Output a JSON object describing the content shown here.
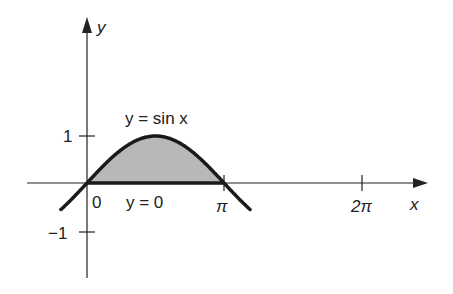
{
  "diagram": {
    "title": "",
    "axes": {
      "x_label": "x",
      "y_label": "y",
      "x_ticks": [
        "0",
        "π",
        "2π"
      ],
      "y_ticks": [
        "1",
        "−1"
      ]
    },
    "curves": [
      {
        "label": "y = sin x",
        "type": "sine"
      },
      {
        "label": "y = 0",
        "type": "baseline"
      }
    ],
    "shaded_region": {
      "from": "0",
      "to": "π",
      "color": "#b8b8b8"
    },
    "colors": {
      "curve": "#1a1a1a",
      "axes": "#222222",
      "fill": "#b8b8b8"
    }
  },
  "chart_data": {
    "type": "line",
    "title": "",
    "xlabel": "x",
    "ylabel": "y",
    "x_tick_labels": [
      "0",
      "π",
      "2π"
    ],
    "y_tick_labels": [
      "−1",
      "1"
    ],
    "series": [
      {
        "name": "y = sin x",
        "x": [
          -0.6,
          0,
          0.785,
          1.571,
          2.356,
          3.1416,
          3.74
        ],
        "values": [
          -0.56,
          0,
          0.707,
          1,
          0.707,
          0,
          -0.56
        ]
      },
      {
        "name": "y = 0",
        "x": [
          0,
          3.1416
        ],
        "values": [
          0,
          0
        ]
      }
    ],
    "shaded_area": {
      "between": [
        "y = sin x",
        "y = 0"
      ],
      "x_range": [
        0,
        3.1416
      ]
    },
    "xlim": [
      -1.4,
      7.4
    ],
    "ylim": [
      -2,
      3.5
    ],
    "grid": false
  }
}
